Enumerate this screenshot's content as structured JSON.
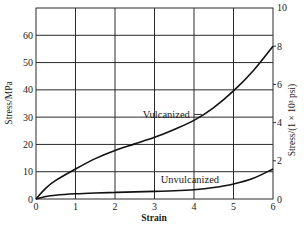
{
  "chart_data": {
    "type": "line",
    "title": "",
    "xlabel": "Strain",
    "ylabel": "Stress/MPa",
    "ylabel_right": "Stress/(1 × 10³ psi)",
    "xlim": [
      0,
      6
    ],
    "ylim": [
      0,
      70
    ],
    "ylim_right": [
      0,
      10
    ],
    "grid": true,
    "x_ticks": [
      0,
      1,
      2,
      3,
      4,
      5,
      6
    ],
    "y_ticks": [
      0,
      10,
      20,
      30,
      40,
      50,
      60
    ],
    "y_ticks_right": [
      0,
      2,
      4,
      6,
      8,
      10
    ],
    "series": [
      {
        "name": "Vulcanized",
        "x": [
          0,
          0.25,
          0.5,
          1,
          1.5,
          2,
          2.5,
          3,
          3.5,
          4,
          4.5,
          5,
          5.5,
          6
        ],
        "values": [
          0,
          4,
          6.8,
          11,
          14.8,
          17.8,
          20.2,
          22.6,
          25.5,
          28.8,
          33.5,
          39.6,
          47,
          56
        ]
      },
      {
        "name": "Unvulcanized",
        "x": [
          0,
          0.25,
          0.5,
          1,
          1.5,
          2,
          2.5,
          3,
          3.5,
          4,
          4.5,
          5,
          5.5,
          6
        ],
        "values": [
          0,
          0.9,
          1.4,
          1.9,
          2.2,
          2.4,
          2.6,
          2.8,
          3.0,
          3.4,
          4.2,
          5.5,
          7.6,
          11
        ]
      }
    ],
    "annotations": [
      {
        "text": "Vulcanized",
        "x": 3.5,
        "y": 31,
        "leader_to": {
          "x": 4.2,
          "y": 31
        }
      },
      {
        "text": "Unvulcanized",
        "x": 4.1,
        "y": 7
      }
    ]
  }
}
